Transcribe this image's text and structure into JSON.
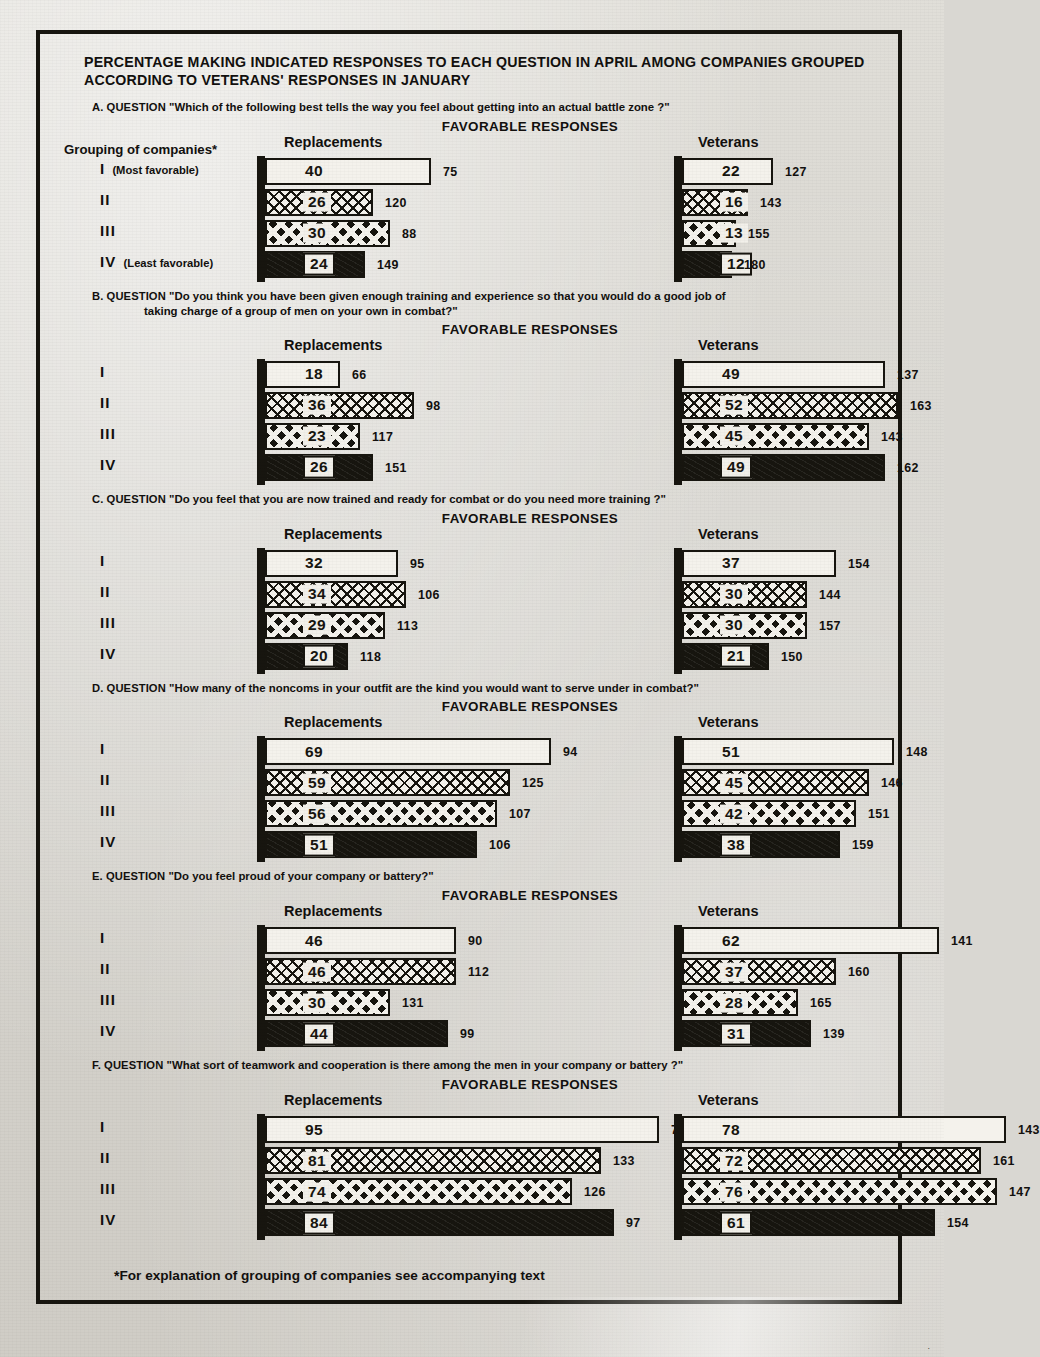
{
  "page": {
    "title": "PERCENTAGE MAKING INDICATED RESPONSES TO EACH QUESTION IN APRIL AMONG COMPANIES GROUPED ACCORDING TO VETERANS' RESPONSES IN JANUARY",
    "grouping_label": "Grouping of companies",
    "grouping_marker": "*",
    "favorable_responses_label": "FAVORABLE RESPONSES",
    "column_replacements": "Replacements",
    "column_veterans": "Veterans",
    "footnote_marker": "*",
    "footnote": "For explanation of grouping of companies see accompanying text",
    "corner_mark": "."
  },
  "row_labels": {
    "I": "I",
    "II": "II",
    "III": "III",
    "IV": "IV",
    "I_note": "(Most favorable)",
    "IV_note": "(Least favorable)"
  },
  "sections": [
    {
      "letter": "A.",
      "question_label": "QUESTION",
      "question": "\"Which of the following best tells the way you feel about getting into an actual battle zone ?\"",
      "question_line2": "",
      "replacements": {
        "values": [
          40,
          26,
          30,
          24
        ],
        "n": [
          75,
          120,
          88,
          149
        ]
      },
      "veterans": {
        "values": [
          22,
          16,
          13,
          12
        ],
        "n": [
          127,
          143,
          155,
          180
        ]
      }
    },
    {
      "letter": "B.",
      "question_label": "QUESTION",
      "question": "\"Do you think you have been given enough training and experience so that you would do a good job of",
      "question_line2": "taking charge of a group of men on your own in combat?\"",
      "replacements": {
        "values": [
          18,
          36,
          23,
          26
        ],
        "n": [
          66,
          98,
          117,
          151
        ]
      },
      "veterans": {
        "values": [
          49,
          52,
          45,
          49
        ],
        "n": [
          137,
          163,
          143,
          162
        ]
      }
    },
    {
      "letter": "C.",
      "question_label": "QUESTION",
      "question": "\"Do you feel that you are now trained and ready for combat or do you need more training ?\"",
      "question_line2": "",
      "replacements": {
        "values": [
          32,
          34,
          29,
          20
        ],
        "n": [
          95,
          106,
          113,
          118
        ]
      },
      "veterans": {
        "values": [
          37,
          30,
          30,
          21
        ],
        "n": [
          154,
          144,
          157,
          150
        ]
      }
    },
    {
      "letter": "D.",
      "question_label": "QUESTION",
      "question": "\"How many of the noncoms in your outfit are the kind you would want to serve under in combat?\"",
      "question_line2": "",
      "replacements": {
        "values": [
          69,
          59,
          56,
          51
        ],
        "n": [
          94,
          125,
          107,
          106
        ]
      },
      "veterans": {
        "values": [
          51,
          45,
          42,
          38
        ],
        "n": [
          148,
          146,
          151,
          159
        ]
      }
    },
    {
      "letter": "E.",
      "question_label": "QUESTION",
      "question": "\"Do you feel proud of your company or battery?\"",
      "question_line2": "",
      "replacements": {
        "values": [
          46,
          46,
          30,
          44
        ],
        "n": [
          90,
          112,
          131,
          99
        ]
      },
      "veterans": {
        "values": [
          62,
          37,
          28,
          31
        ],
        "n": [
          141,
          160,
          165,
          139
        ]
      }
    },
    {
      "letter": "F.",
      "question_label": "QUESTION",
      "question": "\"What sort of teamwork and cooperation is there among the men in your company or battery ?\"",
      "question_line2": "",
      "replacements": {
        "values": [
          95,
          81,
          74,
          84
        ],
        "n": [
          76,
          133,
          126,
          97
        ]
      },
      "veterans": {
        "values": [
          78,
          72,
          76,
          61
        ],
        "n": [
          143,
          161,
          147,
          154
        ]
      }
    }
  ],
  "chart_data": {
    "type": "bar",
    "title": "PERCENTAGE MAKING INDICATED RESPONSES TO EACH QUESTION IN APRIL AMONG COMPANIES GROUPED ACCORDING TO VETERANS' RESPONSES IN JANUARY",
    "subtitle": "FAVORABLE RESPONSES",
    "orientation": "horizontal",
    "xlabel": "Percent favorable",
    "ylabel": "Grouping of companies",
    "xlim": [
      0,
      100
    ],
    "grid": false,
    "legend_position": "none",
    "categories": [
      "I",
      "II",
      "III",
      "IV"
    ],
    "category_notes": [
      "Most favorable",
      "",
      "",
      "Least favorable"
    ],
    "panels": [
      {
        "panel": "A",
        "question": "Which of the following best tells the way you feel about getting into an actual battle zone ?",
        "series": [
          {
            "name": "Replacements",
            "values": [
              40,
              26,
              30,
              24
            ],
            "n": [
              75,
              120,
              88,
              149
            ]
          },
          {
            "name": "Veterans",
            "values": [
              22,
              16,
              13,
              12
            ],
            "n": [
              127,
              143,
              155,
              180
            ]
          }
        ]
      },
      {
        "panel": "B",
        "question": "Do you think you have been given enough training and experience so that you would do a good job of taking charge of a group of men on your own in combat?",
        "series": [
          {
            "name": "Replacements",
            "values": [
              18,
              36,
              23,
              26
            ],
            "n": [
              66,
              98,
              117,
              151
            ]
          },
          {
            "name": "Veterans",
            "values": [
              49,
              52,
              45,
              49
            ],
            "n": [
              137,
              163,
              143,
              162
            ]
          }
        ]
      },
      {
        "panel": "C",
        "question": "Do you feel that you are now trained and ready for combat or do you need more training ?",
        "series": [
          {
            "name": "Replacements",
            "values": [
              32,
              34,
              29,
              20
            ],
            "n": [
              95,
              106,
              113,
              118
            ]
          },
          {
            "name": "Veterans",
            "values": [
              37,
              30,
              30,
              21
            ],
            "n": [
              154,
              144,
              157,
              150
            ]
          }
        ]
      },
      {
        "panel": "D",
        "question": "How many of the noncoms in your outfit are the kind you would want to serve under in combat?",
        "series": [
          {
            "name": "Replacements",
            "values": [
              69,
              59,
              56,
              51
            ],
            "n": [
              94,
              125,
              107,
              106
            ]
          },
          {
            "name": "Veterans",
            "values": [
              51,
              45,
              42,
              38
            ],
            "n": [
              148,
              146,
              151,
              159
            ]
          }
        ]
      },
      {
        "panel": "E",
        "question": "Do you feel proud of your company or battery?",
        "series": [
          {
            "name": "Replacements",
            "values": [
              46,
              46,
              30,
              44
            ],
            "n": [
              90,
              112,
              131,
              99
            ]
          },
          {
            "name": "Veterans",
            "values": [
              62,
              37,
              28,
              31
            ],
            "n": [
              141,
              160,
              165,
              139
            ]
          }
        ]
      },
      {
        "panel": "F",
        "question": "What sort of teamwork and cooperation is there among the men in your company or battery ?",
        "series": [
          {
            "name": "Replacements",
            "values": [
              95,
              81,
              74,
              84
            ],
            "n": [
              76,
              133,
              126,
              97
            ]
          },
          {
            "name": "Veterans",
            "values": [
              78,
              72,
              76,
              61
            ],
            "n": [
              143,
              161,
              147,
              154
            ]
          }
        ]
      }
    ],
    "note": "Numbers inside bars are percent favorable; small numbers to the right of each bar are the number of cases (N)."
  }
}
